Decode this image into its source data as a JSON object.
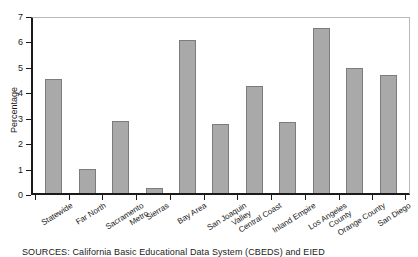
{
  "chart_data": {
    "type": "bar",
    "title": "",
    "xlabel": "",
    "ylabel": "Percentage",
    "ylim": [
      0,
      7
    ],
    "yticks": [
      0,
      1,
      2,
      3,
      4,
      5,
      6,
      7
    ],
    "grid": false,
    "legend": null,
    "bar_color": "#a9a9a9",
    "bar_edge_color": "#7c7c7c",
    "categories": [
      "Statewide",
      "Far North",
      "Sacramento Metro",
      "Sierras",
      "Bay Area",
      "San Joaquin Valley",
      "Central Coast",
      "Inland Empire",
      "Los Angeles County",
      "Orange County",
      "San Diego"
    ],
    "category_lines": [
      [
        "Statewide",
        ""
      ],
      [
        "Far North",
        ""
      ],
      [
        "Sacramento",
        "Metro"
      ],
      [
        "Sierras",
        ""
      ],
      [
        "Bay Area",
        ""
      ],
      [
        "San Joaquin",
        "Valley"
      ],
      [
        "Central Coast",
        ""
      ],
      [
        "Inland Empire",
        ""
      ],
      [
        "Los Angeles",
        "County"
      ],
      [
        "Orange County",
        ""
      ],
      [
        "San Diego",
        ""
      ]
    ],
    "values": [
      4.5,
      0.95,
      2.85,
      0.2,
      6.0,
      2.7,
      4.2,
      2.8,
      6.5,
      4.9,
      4.65
    ]
  },
  "caption": {
    "source_label": "SOURCES:",
    "source_text": "California Basic Educational Data System (CBEDS) and EIED"
  }
}
